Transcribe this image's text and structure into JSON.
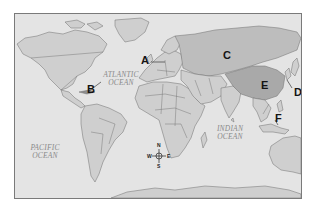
{
  "map": {
    "type": "world-political-outline",
    "colors": {
      "ocean": "#e4e4e4",
      "land": "#cfcfcf",
      "land_highlight_c": "#bdbdbd",
      "land_highlight_e": "#a9a9a9",
      "border": "#6f6f6f",
      "frame": "#7a7a7a",
      "label": "#141414",
      "ocean_label": "#8a8a8a"
    },
    "ocean_labels": [
      {
        "id": "atlantic",
        "text": "ATLANTIC\nOCEAN"
      },
      {
        "id": "pacific",
        "text": "PACIFIC\nOCEAN"
      },
      {
        "id": "indian",
        "text": "INDIAN\nOCEAN"
      }
    ],
    "region_labels": [
      {
        "letter": "A",
        "points_to": "northern Europe (Denmark/Baltic area)"
      },
      {
        "letter": "B",
        "points_to": "Caribbean (Cuba area)"
      },
      {
        "letter": "C",
        "points_to": "Russia"
      },
      {
        "letter": "D",
        "points_to": "Japan / East Asian coast"
      },
      {
        "letter": "E",
        "points_to": "China"
      },
      {
        "letter": "F",
        "points_to": "Southeast Asia (Philippines area)"
      }
    ],
    "compass": {
      "north": "N",
      "south": "S",
      "east": "E",
      "west": "W"
    }
  }
}
